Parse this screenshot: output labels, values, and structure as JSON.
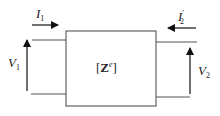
{
  "diagram": {
    "type": "two-port network",
    "block": {
      "label_open": "[",
      "label_main": "Z",
      "label_sup": "e",
      "label_close": "]"
    },
    "port1": {
      "current": {
        "symbol": "I",
        "sub": "1",
        "direction": "into block"
      },
      "voltage": {
        "symbol": "V",
        "sub": "1",
        "direction": "up"
      }
    },
    "port2": {
      "current": {
        "symbol": "I",
        "prime": "′",
        "sub": "2",
        "direction": "into block"
      },
      "voltage": {
        "symbol": "V",
        "sub": "2",
        "direction": "up"
      }
    },
    "colors": {
      "line": "#333333",
      "background": "#ffffff"
    }
  }
}
